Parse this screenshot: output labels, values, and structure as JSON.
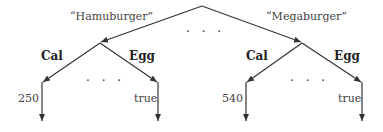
{
  "diagram": {
    "type": "tree",
    "root": {
      "children": [
        {
          "edge_label": "“Hamuburger”",
          "children": [
            {
              "edge_label": "Cal",
              "value": "250"
            },
            {
              "edge_label": "Egg",
              "value": "true"
            }
          ],
          "ellipsis": "· · ·"
        },
        {
          "edge_label": "“Megaburger”",
          "children": [
            {
              "edge_label": "Cal",
              "value": "540"
            },
            {
              "edge_label": "Egg",
              "value": "true"
            }
          ],
          "ellipsis": "· · ·"
        }
      ],
      "ellipsis": "· · ·"
    }
  }
}
